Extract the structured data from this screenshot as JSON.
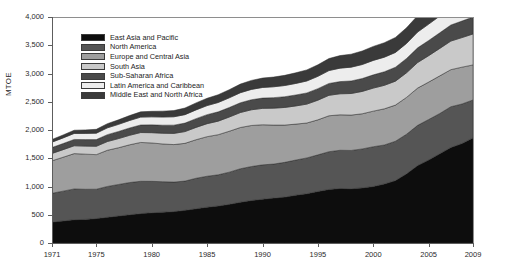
{
  "chart_data": {
    "type": "area",
    "title": "",
    "subtitle": "",
    "xlabel": "",
    "ylabel": "MTOE",
    "xlim": [
      1971,
      2009
    ],
    "ylim": [
      0,
      4000
    ],
    "grid": false,
    "legend_position": "top-left",
    "stacked": true,
    "y_ticks": [
      "0",
      "500",
      "1,000",
      "1,500",
      "2,000",
      "2,500",
      "3,000",
      "3,500",
      "4,000"
    ],
    "y_tick_values": [
      0,
      500,
      1000,
      1500,
      2000,
      2500,
      3000,
      3500,
      4000
    ],
    "x_ticks": [
      "1971",
      "1975",
      "1980",
      "1985",
      "1990",
      "1995",
      "2000",
      "2005",
      "2009"
    ],
    "x_tick_values": [
      1971,
      1975,
      1980,
      1985,
      1990,
      1995,
      2000,
      2005,
      2009
    ],
    "x": [
      1971,
      1972,
      1973,
      1974,
      1975,
      1976,
      1977,
      1978,
      1979,
      1980,
      1981,
      1982,
      1983,
      1984,
      1985,
      1986,
      1987,
      1988,
      1989,
      1990,
      1991,
      1992,
      1993,
      1994,
      1995,
      1996,
      1997,
      1998,
      1999,
      2000,
      2001,
      2002,
      2003,
      2004,
      2005,
      2006,
      2007,
      2008,
      2009
    ],
    "series": [
      {
        "name": "East Asia and Pacific",
        "color": "#0d0d0d",
        "values": [
          370,
          390,
          412,
          418,
          432,
          455,
          478,
          500,
          520,
          535,
          545,
          556,
          578,
          606,
          634,
          655,
          684,
          722,
          752,
          775,
          795,
          812,
          846,
          872,
          912,
          948,
          965,
          960,
          975,
          1000,
          1045,
          1105,
          1225,
          1370,
          1470,
          1580,
          1690,
          1760,
          1860
        ]
      },
      {
        "name": "North America",
        "color": "#555555",
        "values": [
          510,
          528,
          545,
          533,
          520,
          546,
          558,
          570,
          572,
          556,
          540,
          522,
          518,
          540,
          548,
          552,
          570,
          592,
          602,
          608,
          602,
          615,
          622,
          634,
          648,
          668,
          676,
          678,
          690,
          704,
          690,
          696,
          700,
          712,
          716,
          712,
          722,
          700,
          672
        ]
      },
      {
        "name": "Europe and Central Asia",
        "color": "#9e9e9e",
        "values": [
          575,
          600,
          625,
          622,
          612,
          640,
          650,
          668,
          688,
          680,
          668,
          664,
          668,
          682,
          700,
          710,
          724,
          730,
          726,
          710,
          690,
          660,
          636,
          618,
          620,
          636,
          628,
          626,
          622,
          630,
          640,
          640,
          652,
          660,
          662,
          666,
          656,
          652,
          620
        ]
      },
      {
        "name": "South Asia",
        "color": "#c9c9c9",
        "values": [
          130,
          134,
          139,
          142,
          148,
          155,
          162,
          168,
          175,
          182,
          190,
          198,
          208,
          218,
          230,
          240,
          252,
          265,
          278,
          290,
          300,
          312,
          322,
          334,
          348,
          362,
          372,
          382,
          396,
          408,
          416,
          424,
          436,
          452,
          468,
          486,
          506,
          524,
          548
        ]
      },
      {
        "name": "Sub-Saharan Africa",
        "color": "#4a4a4a",
        "values": [
          105,
          108,
          112,
          115,
          118,
          122,
          126,
          130,
          134,
          138,
          142,
          146,
          150,
          155,
          160,
          164,
          168,
          173,
          178,
          182,
          186,
          190,
          194,
          198,
          204,
          210,
          216,
          222,
          228,
          234,
          240,
          246,
          252,
          260,
          268,
          276,
          284,
          292,
          300
        ]
      },
      {
        "name": "Latin America and Caribbean",
        "color": "#ededed",
        "values": [
          95,
          100,
          106,
          110,
          114,
          120,
          126,
          132,
          139,
          142,
          145,
          148,
          150,
          155,
          160,
          166,
          172,
          178,
          183,
          188,
          192,
          198,
          204,
          212,
          218,
          228,
          238,
          244,
          248,
          256,
          258,
          262,
          268,
          280,
          290,
          298,
          310,
          318,
          318
        ]
      },
      {
        "name": "Middle East and North Africa",
        "color": "#3a3a3a",
        "values": [
          48,
          52,
          57,
          62,
          68,
          74,
          80,
          87,
          93,
          98,
          104,
          110,
          117,
          124,
          130,
          137,
          144,
          152,
          159,
          166,
          172,
          180,
          188,
          196,
          204,
          213,
          222,
          230,
          239,
          248,
          256,
          265,
          276,
          290,
          302,
          316,
          330,
          344,
          356
        ]
      }
    ]
  },
  "axis": {
    "y_title": "MTOE"
  },
  "legend": {
    "items": [
      {
        "label": "East Asia and Pacific"
      },
      {
        "label": "North America"
      },
      {
        "label": "Europe and Central Asia"
      },
      {
        "label": "South Asia"
      },
      {
        "label": "Sub-Saharan Africa"
      },
      {
        "label": "Latin America and Caribbean"
      },
      {
        "label": "Middle East and North Africa"
      }
    ]
  }
}
